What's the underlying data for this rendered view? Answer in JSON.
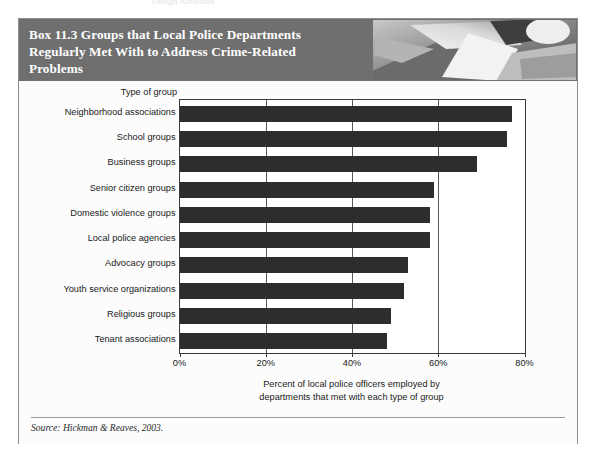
{
  "scan": {
    "top_partial_text": "Design Activities"
  },
  "box": {
    "title": "Box 11.3  Groups that Local Police Departments\nRegularly Met With to Address Crime-Related\nProblems",
    "header_bg": "#6f6f6f",
    "header_text_color": "#ffffff",
    "photo_alt": "police-photo",
    "source": "Source: Hickman & Reaves, 2003."
  },
  "chart_data": {
    "type": "bar",
    "orientation": "horizontal",
    "title": "Box 11.3  Groups that Local Police Departments Regularly Met With to Address Crime-Related Problems",
    "subtitle": "",
    "xlabel": "Percent of local police officers employed by\ndepartments that met with each type of group",
    "ylabel": "Type of group",
    "xlim": [
      0,
      80
    ],
    "xticks": [
      0,
      20,
      40,
      60,
      80
    ],
    "xticklabels": [
      "0%",
      "20%",
      "40%",
      "60%",
      "80%"
    ],
    "grid": true,
    "grid_axis": "x",
    "legend": false,
    "bar_color": "#2d2d2d",
    "categories": [
      "Neighborhood associations",
      "School groups",
      "Business groups",
      "Senior citizen groups",
      "Domestic violence groups",
      "Local police agencies",
      "Advocacy groups",
      "Youth service organizations",
      "Religious groups",
      "Tenant associations"
    ],
    "values": [
      77,
      76,
      69,
      59,
      58,
      58,
      53,
      52,
      49,
      48
    ],
    "value_unit": "%",
    "source": "Source: Hickman & Reaves, 2003."
  }
}
